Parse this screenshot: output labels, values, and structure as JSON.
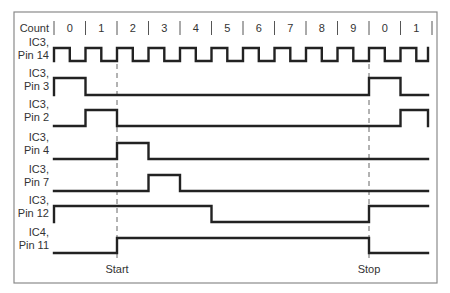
{
  "diagram": {
    "header_label": "Count",
    "counts": [
      "0",
      "1",
      "2",
      "3",
      "4",
      "5",
      "6",
      "7",
      "8",
      "9",
      "0",
      "1"
    ],
    "markers": [
      {
        "label": "Start",
        "x": 117
      },
      {
        "label": "Stop",
        "x": 369
      }
    ],
    "signals": [
      {
        "id": "ic3-pin14",
        "label_line1": "IC3,",
        "label_line2": "Pin 14",
        "description": "Clock",
        "high_y": 48,
        "low_y": 61
      },
      {
        "id": "ic3-pin3",
        "label_line1": "IC3,",
        "label_line2": "Pin 3",
        "high_y": 78,
        "low_y": 95,
        "states": [
          "1",
          "0",
          "0",
          "0",
          "0",
          "0",
          "0",
          "0",
          "0",
          "0",
          "1",
          "0"
        ]
      },
      {
        "id": "ic3-pin2",
        "label_line1": "IC3,",
        "label_line2": "Pin 2",
        "high_y": 110,
        "low_y": 126,
        "states": [
          "0",
          "1",
          "0",
          "0",
          "0",
          "0",
          "0",
          "0",
          "0",
          "0",
          "0",
          "1"
        ]
      },
      {
        "id": "ic3-pin4",
        "label_line1": "IC3,",
        "label_line2": "Pin 4",
        "high_y": 143,
        "low_y": 159,
        "states": [
          "0",
          "0",
          "1",
          "0",
          "0",
          "0",
          "0",
          "0",
          "0",
          "0",
          "0",
          "0"
        ]
      },
      {
        "id": "ic3-pin7",
        "label_line1": "IC3,",
        "label_line2": "Pin 7",
        "high_y": 175,
        "low_y": 191,
        "states": [
          "0",
          "0",
          "0",
          "1",
          "0",
          "0",
          "0",
          "0",
          "0",
          "0",
          "0",
          "0"
        ]
      },
      {
        "id": "ic3-pin12",
        "label_line1": "IC3,",
        "label_line2": "Pin 12",
        "high_y": 206,
        "low_y": 222,
        "states": [
          "1",
          "1",
          "1",
          "1",
          "1",
          "0",
          "0",
          "0",
          "0",
          "0",
          "1",
          "1"
        ]
      },
      {
        "id": "ic4-pin11",
        "label_line1": "IC4,",
        "label_line2": "Pin 11",
        "high_y": 238,
        "low_y": 253,
        "states": [
          "0",
          "0",
          "1",
          "1",
          "1",
          "1",
          "1",
          "1",
          "1",
          "1",
          "0",
          "0"
        ]
      }
    ]
  },
  "colors": {
    "waveform": "#222222",
    "frame": "#8a8a8a",
    "text": "#333333",
    "background": "#ffffff"
  }
}
